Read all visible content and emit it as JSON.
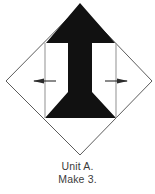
{
  "figure": {
    "colors": {
      "patch_fill": "#111111",
      "background": "#ffffff",
      "outline": "#4a4a4a",
      "guide_line": "#9a9a9a",
      "marker": "#2b2b2b",
      "caption_text": "#3c3c3c"
    },
    "diamond": {
      "name": "on-point-square-outline",
      "top": [
        80,
        6
      ],
      "right": [
        152,
        81
      ],
      "bottom": [
        80,
        155
      ],
      "left": [
        6,
        81
      ],
      "stroke_width": 0.9
    },
    "arrow_patch": {
      "name": "center-arrow-patch",
      "description": "solid black arrow pointing up with flared base",
      "apex": [
        80,
        3
      ],
      "shaft_left_x": 68,
      "shaft_right_x": 92,
      "head_left": [
        47,
        43
      ],
      "head_right": [
        113,
        43
      ],
      "base_y": 118,
      "flare_left_x": 45,
      "flare_right_x": 116
    },
    "guides": [
      {
        "name": "left-vertical-guide",
        "x": 45,
        "y_top": 43,
        "y_bottom": 118
      },
      {
        "name": "right-vertical-guide",
        "x": 116,
        "y_top": 43,
        "y_bottom": 118
      }
    ],
    "markers": [
      {
        "name": "left-direction-marker",
        "cx": 45,
        "cy": 81,
        "direction": "horizontal",
        "arrow_points": "left"
      },
      {
        "name": "right-direction-marker",
        "cx": 116,
        "cy": 81,
        "direction": "horizontal",
        "arrow_points": "right"
      }
    ]
  },
  "caption": {
    "line1": "Unit A.",
    "line2": "Make 3."
  }
}
